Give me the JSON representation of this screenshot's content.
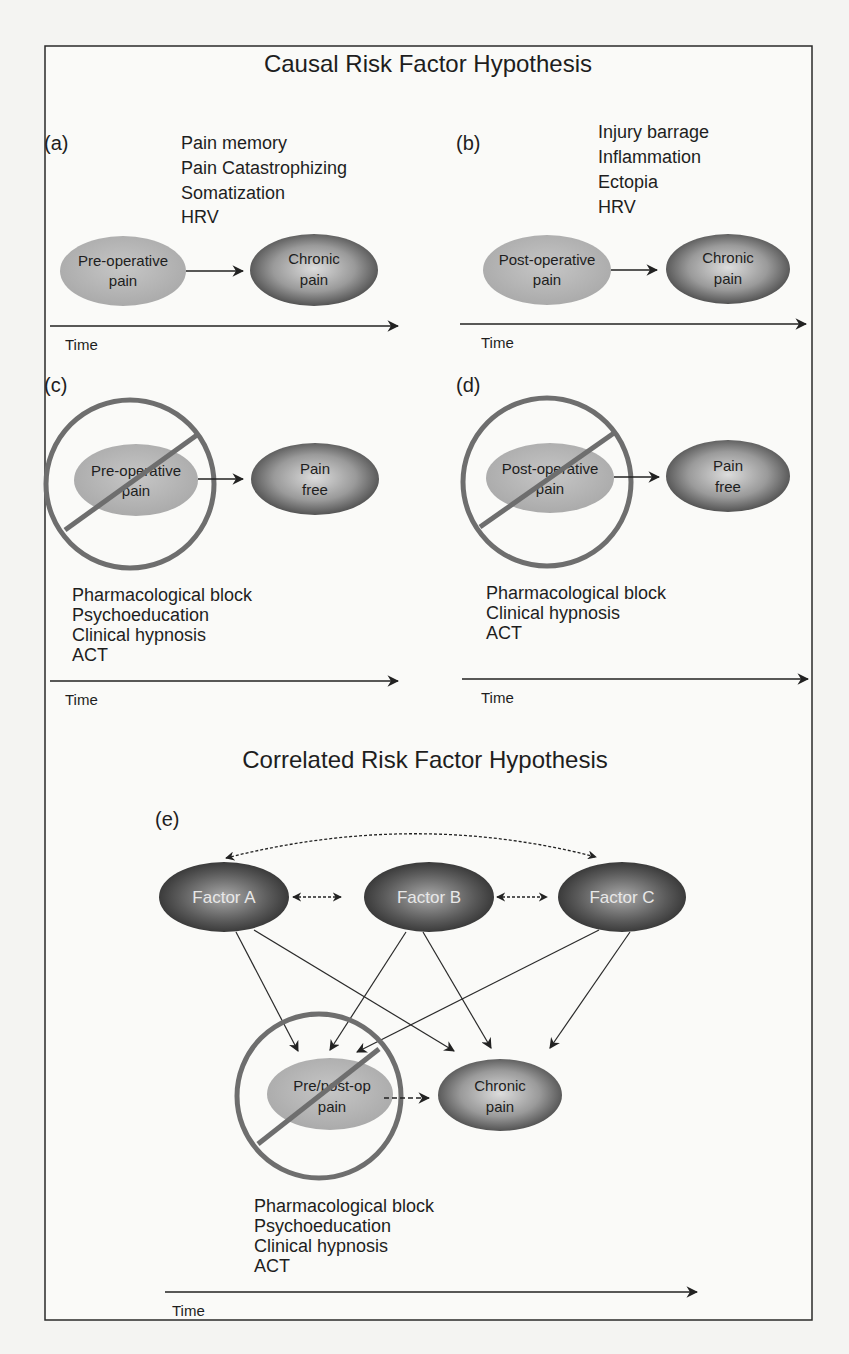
{
  "titles": {
    "causal": "Causal Risk Factor Hypothesis",
    "correlated": "Correlated Risk Factor Hypothesis"
  },
  "panels": {
    "a": {
      "label": "(a)",
      "factors": [
        "Pain memory",
        "Pain Catastrophizing",
        "Somatization",
        "HRV"
      ],
      "source_node": [
        "Pre-operative",
        "pain"
      ],
      "target_node": [
        "Chronic",
        "pain"
      ],
      "time_label": "Time"
    },
    "b": {
      "label": "(b)",
      "factors": [
        "Injury barrage",
        "Inflammation",
        "Ectopia",
        "HRV"
      ],
      "source_node": [
        "Post-operative",
        "pain"
      ],
      "target_node": [
        "Chronic",
        "pain"
      ],
      "time_label": "Time"
    },
    "c": {
      "label": "(c)",
      "source_node": [
        "Pre-operative",
        "pain"
      ],
      "target_node": [
        "Pain",
        "free"
      ],
      "interventions": [
        "Pharmacological block",
        "Psychoeducation",
        "Clinical hypnosis",
        "ACT"
      ],
      "time_label": "Time",
      "blocked": true
    },
    "d": {
      "label": "(d)",
      "source_node": [
        "Post-operative",
        "pain"
      ],
      "target_node": [
        "Pain",
        "free"
      ],
      "interventions": [
        "Pharmacological block",
        "Clinical hypnosis",
        "ACT"
      ],
      "time_label": "Time",
      "blocked": true
    },
    "e": {
      "label": "(e)",
      "factor_nodes": [
        "Factor A",
        "Factor B",
        "Factor C"
      ],
      "source_node": [
        "Pre/post-op",
        "pain"
      ],
      "target_node": [
        "Chronic",
        "pain"
      ],
      "interventions": [
        "Pharmacological block",
        "Psychoeducation",
        "Clinical hypnosis",
        "ACT"
      ],
      "time_label": "Time",
      "blocked": true
    }
  },
  "colors": {
    "light_node": "#b4b4b4",
    "dark_node_center": "#d8d8d8",
    "dark_node_edge": "#3e3e3e",
    "prohibition_ring": "#6e6e6e",
    "line": "#2a2a2a"
  }
}
